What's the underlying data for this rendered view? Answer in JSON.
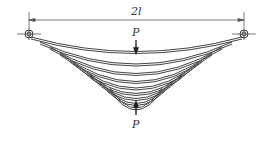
{
  "diagram": {
    "type": "leaf-spring",
    "dimension_label": "2l",
    "load_top_label": "P",
    "load_bottom_label": "P",
    "leaf_count": 9,
    "colors": {
      "stroke": "#444444",
      "background": "#ffffff"
    }
  }
}
